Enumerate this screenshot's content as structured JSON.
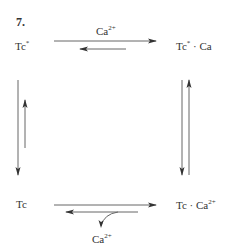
{
  "figure_number": "7.",
  "nodes": {
    "top_left": {
      "base": "Tc",
      "sup": "*"
    },
    "top_right": {
      "base": "Tc",
      "sup": "*",
      "suffix": " · Ca"
    },
    "bottom_left": {
      "base": "Tc"
    },
    "bottom_right": {
      "base": "Tc · Ca",
      "sup": "2+"
    }
  },
  "labels": {
    "top_ion": {
      "base": "Ca",
      "sup": "2+"
    },
    "bottom_ion": {
      "base": "Ca",
      "sup": "2+"
    }
  },
  "colors": {
    "line": "#555555",
    "text": "#333333"
  }
}
